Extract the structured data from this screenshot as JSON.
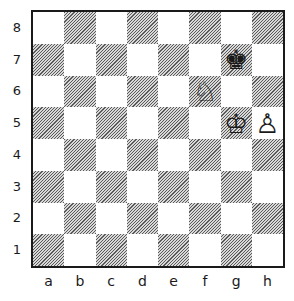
{
  "diagram": {
    "type": "chess-position",
    "files": [
      "a",
      "b",
      "c",
      "d",
      "e",
      "f",
      "g",
      "h"
    ],
    "ranks": [
      "8",
      "7",
      "6",
      "5",
      "4",
      "3",
      "2",
      "1"
    ],
    "pieces": [
      {
        "square": "g7",
        "piece": "black-king",
        "glyph": "♚"
      },
      {
        "square": "f6",
        "piece": "white-knight",
        "glyph": "♘"
      },
      {
        "square": "g5",
        "piece": "white-king",
        "glyph": "♔"
      },
      {
        "square": "h5",
        "piece": "white-pawn",
        "glyph": "♙"
      }
    ],
    "colors": {
      "border": "#1a1a1a",
      "dark_square_hatch": "#5a5a5a",
      "light_square": "#ffffff"
    }
  }
}
